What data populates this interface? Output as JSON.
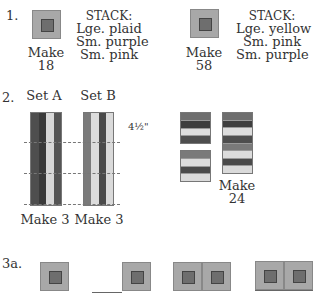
{
  "colors": {
    "dark": "#4a4a4a",
    "darker": "#3c3c3c",
    "medium": "#7a7a7a",
    "light": "#d6d6d6",
    "square_outer": "#a8a8a8",
    "square_inner": "#6e6e6e"
  },
  "step1": {
    "label": "1.",
    "blocks": [
      {
        "make_label": "Make",
        "make_count": "18",
        "stack_title": "STACK:",
        "stack_lines": [
          "Lge. plaid",
          "Sm. purple",
          "Sm. pink"
        ]
      },
      {
        "make_label": "Make",
        "make_count": "58",
        "stack_title": "STACK:",
        "stack_lines": [
          "Lge. yellow",
          "Sm. pink",
          "Sm. purple"
        ]
      }
    ]
  },
  "step2": {
    "label": "2.",
    "set_a": {
      "title": "Set A",
      "make": "Make 3",
      "strips": [
        "dark",
        "darker",
        "light",
        "dark"
      ]
    },
    "set_b": {
      "title": "Set B",
      "make": "Make 3",
      "strips": [
        "medium",
        "light",
        "dark",
        "light"
      ]
    },
    "measurement": "4½\"",
    "cut_blocks": {
      "small_top": [
        "medium",
        "darker",
        "light",
        "dark"
      ],
      "small_bottom": [
        "medium",
        "light",
        "dark",
        "light"
      ],
      "tall": [
        "medium",
        "darker",
        "light",
        "dark",
        "medium",
        "light",
        "dark",
        "light"
      ],
      "make_label": "Make",
      "make_count": "24"
    }
  },
  "step3a": {
    "label": "3a."
  }
}
